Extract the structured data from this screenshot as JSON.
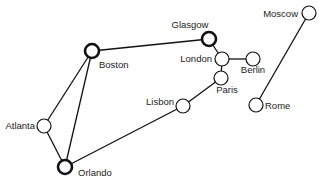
{
  "diagram": {
    "type": "graph",
    "nodes": [
      {
        "id": "boston",
        "label": "Boston",
        "x": 92,
        "y": 51,
        "highlight": true,
        "lx": 99,
        "ly": 68,
        "anchor": "start"
      },
      {
        "id": "glasgow",
        "label": "Glasgow",
        "x": 209,
        "y": 39,
        "highlight": true,
        "lx": 190,
        "ly": 28,
        "anchor": "middle"
      },
      {
        "id": "london",
        "label": "London",
        "x": 222,
        "y": 59,
        "highlight": false,
        "lx": 212,
        "ly": 62,
        "anchor": "end"
      },
      {
        "id": "berlin",
        "label": "Berlin",
        "x": 253,
        "y": 59,
        "highlight": false,
        "lx": 253,
        "ly": 73,
        "anchor": "middle"
      },
      {
        "id": "paris",
        "label": "Paris",
        "x": 221,
        "y": 78,
        "highlight": false,
        "lx": 227,
        "ly": 93,
        "anchor": "middle"
      },
      {
        "id": "moscow",
        "label": "Moscow",
        "x": 309,
        "y": 13,
        "highlight": false,
        "lx": 298,
        "ly": 17,
        "anchor": "end"
      },
      {
        "id": "rome",
        "label": "Rome",
        "x": 256,
        "y": 105,
        "highlight": false,
        "lx": 265,
        "ly": 109,
        "anchor": "start"
      },
      {
        "id": "lisbon",
        "label": "Lisbon",
        "x": 183,
        "y": 106,
        "highlight": false,
        "lx": 174,
        "ly": 105,
        "anchor": "end"
      },
      {
        "id": "atlanta",
        "label": "Atlanta",
        "x": 44,
        "y": 126,
        "highlight": false,
        "lx": 35,
        "ly": 129,
        "anchor": "end"
      },
      {
        "id": "orlando",
        "label": "Orlando",
        "x": 65,
        "y": 167,
        "highlight": true,
        "lx": 78,
        "ly": 176,
        "anchor": "start"
      }
    ],
    "edges": [
      [
        "boston",
        "glasgow"
      ],
      [
        "boston",
        "atlanta"
      ],
      [
        "boston",
        "orlando"
      ],
      [
        "atlanta",
        "orlando"
      ],
      [
        "orlando",
        "lisbon"
      ],
      [
        "lisbon",
        "paris"
      ],
      [
        "paris",
        "london"
      ],
      [
        "london",
        "glasgow"
      ],
      [
        "london",
        "berlin"
      ],
      [
        "moscow",
        "rome"
      ]
    ],
    "colors": {
      "stroke": "#111111",
      "fill": "#ffffff",
      "text": "#222222"
    }
  }
}
